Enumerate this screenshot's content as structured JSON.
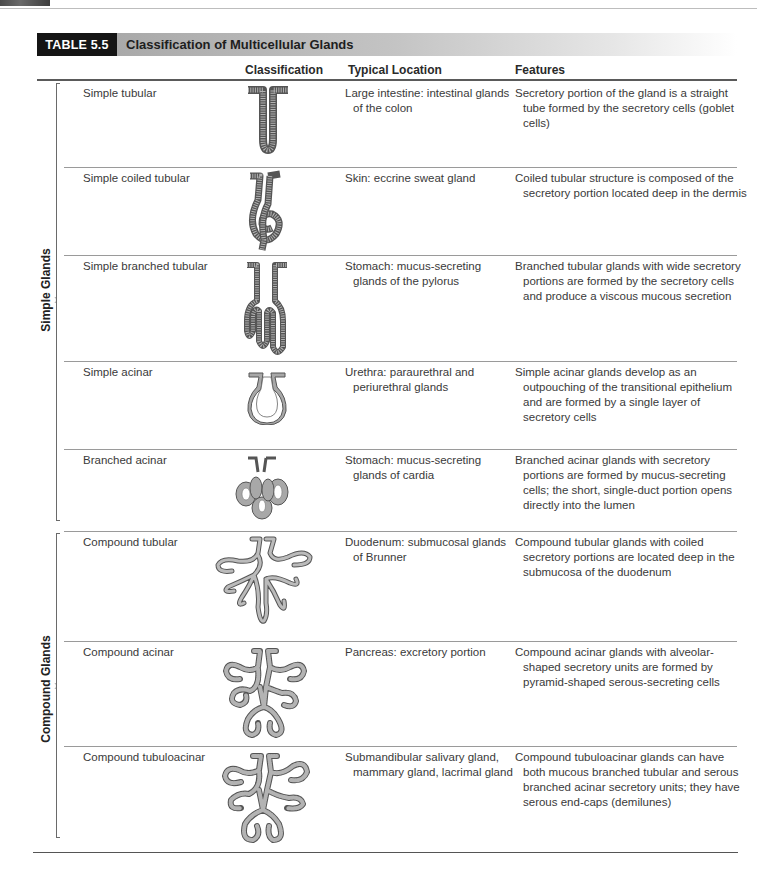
{
  "table": {
    "badge": "TABLE 5.5",
    "title": "Classification of Multicellular Glands",
    "columns": {
      "classification": "Classification",
      "location": "Typical Location",
      "features": "Features"
    },
    "groups": [
      {
        "label": "Simple Glands"
      },
      {
        "label": "Compound Glands"
      }
    ],
    "rows": [
      {
        "name": "Simple tubular",
        "illustration": "simple-tubular-gland-illustration",
        "location": "Large intestine: intestinal glands of the colon",
        "features": "Secretory portion of the gland is a straight tube formed by the secretory cells (goblet cells)"
      },
      {
        "name": "Simple coiled tubular",
        "illustration": "simple-coiled-tubular-gland-illustration",
        "location": "Skin: eccrine sweat gland",
        "features": "Coiled tubular structure is composed of the secretory portion located deep in the dermis"
      },
      {
        "name": "Simple branched tubular",
        "illustration": "simple-branched-tubular-gland-illustration",
        "location": "Stomach: mucus-secreting glands of the pylorus",
        "features": "Branched tubular glands with wide secretory portions are formed by the secretory cells and produce a viscous mucous secretion"
      },
      {
        "name": "Simple acinar",
        "illustration": "simple-acinar-gland-illustration",
        "location": "Urethra: paraurethral and periurethral glands",
        "features": "Simple acinar glands develop as an outpouching of the transitional epithelium and are formed by a single layer of secretory cells"
      },
      {
        "name": "Branched acinar",
        "illustration": "branched-acinar-gland-illustration",
        "location": "Stomach: mucus-secreting glands of cardia",
        "features": "Branched acinar glands with secretory portions are formed by mucus-secreting cells; the short, single-duct portion opens directly into the lumen"
      },
      {
        "name": "Compound tubular",
        "illustration": "compound-tubular-gland-illustration",
        "location": "Duodenum: submucosal glands of Brunner",
        "features": "Compound tubular glands with coiled secretory portions are located deep in the submucosa of the duodenum"
      },
      {
        "name": "Compound acinar",
        "illustration": "compound-acinar-gland-illustration",
        "location": "Pancreas: excretory portion",
        "features": "Compound acinar glands with alveolar-shaped secretory units are formed by pyramid-shaped serous-secreting cells"
      },
      {
        "name": "Compound tubuloacinar",
        "illustration": "compound-tubuloacinar-gland-illustration",
        "location": "Submandibular salivary gland, mammary gland, lacrimal gland",
        "features": "Compound tubuloacinar glands can have both mucous branched tubular and serous branched acinar secretory units; they have serous end-caps (demilunes)"
      }
    ]
  },
  "colors": {
    "badge_bg": "#151515",
    "title_bar_gradient_start": "#a9a9a9",
    "gland_fill": "#9a9a9a",
    "gland_stroke": "#555555"
  }
}
